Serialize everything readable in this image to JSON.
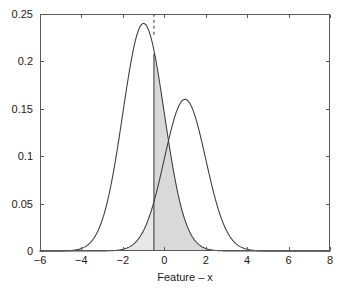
{
  "chart_data": {
    "type": "line",
    "title": "",
    "subtitle": "",
    "xlabel": "Feature – x",
    "ylabel": "",
    "xlim": [
      -6,
      8
    ],
    "ylim": [
      0,
      0.25
    ],
    "grid": false,
    "legend": null,
    "x_ticks": [
      -6,
      -4,
      -2,
      0,
      2,
      4,
      6,
      8
    ],
    "x_tick_labels": [
      "−6",
      "−4",
      "−2",
      "0",
      "2",
      "4",
      "6",
      "8"
    ],
    "y_ticks": [
      0,
      0.05,
      0.1,
      0.15,
      0.2,
      0.25
    ],
    "y_tick_labels": [
      "0",
      "0.05",
      "0.1",
      "0.15",
      "0.2",
      "0.25"
    ],
    "series": [
      {
        "name": "class-1-density",
        "type": "gaussian-pdf",
        "mean": -1.0,
        "sigma": 1.0,
        "peak_value": 0.24,
        "peak_x": -1.0,
        "color": "#333333"
      },
      {
        "name": "class-2-density",
        "type": "gaussian-pdf",
        "mean": 1.0,
        "sigma": 1.0,
        "peak_value": 0.16,
        "peak_x": 1.0,
        "color": "#333333"
      }
    ],
    "annotations": [
      {
        "name": "decision-threshold-dashed",
        "type": "vline",
        "x": -0.5,
        "style": "dashed",
        "y_from": 0.228,
        "y_to": 0.25,
        "color": "#333333"
      },
      {
        "name": "decision-threshold-solid",
        "type": "vline",
        "x": -0.5,
        "style": "solid",
        "y_from": 0.0,
        "y_to": 0.208,
        "color": "#333333"
      }
    ],
    "shaded_regions": [
      {
        "name": "false-positive-area",
        "series": "class-2-density",
        "x_from": -6,
        "x_to": -0.5,
        "fill": "#e8e8e8"
      },
      {
        "name": "false-negative-area",
        "series": "class-1-density",
        "x_from": -0.5,
        "x_to": 8,
        "fill": "#d9d9d9"
      }
    ],
    "axis_color": "#4d4d4d",
    "background": "#ffffff"
  }
}
